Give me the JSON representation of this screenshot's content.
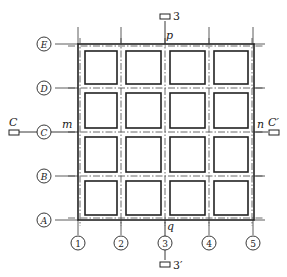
{
  "diagram": {
    "type": "structural-floor-plan",
    "grid": {
      "columns": [
        "1",
        "2",
        "3",
        "4",
        "5"
      ],
      "rows": [
        "E",
        "D",
        "C",
        "B",
        "A"
      ]
    },
    "section_markers": {
      "vertical": {
        "top": "3",
        "bottom": "3′"
      },
      "horizontal": {
        "left": "C",
        "right": "C′"
      }
    },
    "point_labels": {
      "top": "p",
      "bottom": "q",
      "left": "m",
      "right": "n"
    },
    "colors": {
      "line": "#222222",
      "background": "#ffffff"
    }
  }
}
